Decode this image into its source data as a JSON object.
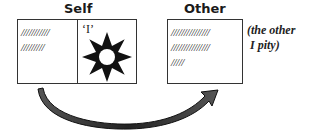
{
  "self": {
    "title": "Self",
    "left_lines": [
      "///////////",
      "/////////"
    ],
    "right_label": "‘I’",
    "icon": "sun-star-icon"
  },
  "other": {
    "title": "Other",
    "lines": [
      "///////////////",
      "///////////////",
      "/////"
    ],
    "annotation_line1": "(the other",
    "annotation_line2": "I pity)"
  },
  "arrow": {
    "from": "self",
    "to": "other",
    "icon": "curved-arrow-icon"
  }
}
